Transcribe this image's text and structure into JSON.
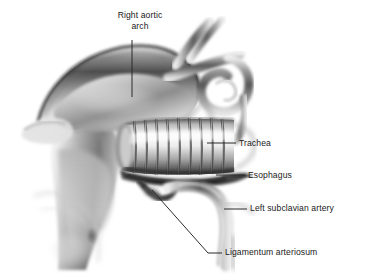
{
  "figure": {
    "style": "grayscale airbrush medical illustration",
    "background_color": "#ffffff",
    "label_color": "#1a1a1a",
    "leader_line_color": "#2b2b2b"
  },
  "labels": {
    "right_aortic_arch": "Right aortic\narch",
    "right_aortic_arch_line1": "Right aortic",
    "right_aortic_arch_line2": "arch",
    "trachea": "Trachea",
    "esophagus": "Esophagus",
    "left_subclavian_artery": "Left subclavian artery",
    "ligamentum_arteriosum": "Ligamentum arteriosum"
  },
  "leader_lines": [
    {
      "name": "right-aortic-arch-leader",
      "type": "vertical",
      "x1": 132,
      "y1": 40,
      "x2": 132,
      "y2": 97
    },
    {
      "name": "trachea-leader",
      "type": "horizontal",
      "x1": 207,
      "y1": 143,
      "x2": 236,
      "y2": 143
    },
    {
      "name": "esophagus-leader",
      "type": "horizontal",
      "x1": 216,
      "y1": 175,
      "x2": 245,
      "y2": 175
    },
    {
      "name": "left-subclavian-leader",
      "type": "horizontal",
      "x1": 224,
      "y1": 209,
      "x2": 247,
      "y2": 209
    },
    {
      "name": "ligamentum-leader",
      "type": "elbow",
      "x1": 152,
      "y1": 190,
      "x2": 208,
      "y2": 253,
      "x3": 222,
      "y3": 253
    }
  ],
  "structures": [
    {
      "name": "right-aortic-arch",
      "description": "large shaded dome arching across upper-left to center"
    },
    {
      "name": "brachiocephalic-branch-vessels",
      "description": "crossing vessels forming a loop at upper right"
    },
    {
      "name": "trachea",
      "description": "horizontal tube with cartilage rings, center of image",
      "cartilage_ring_count": 9
    },
    {
      "name": "esophagus",
      "description": "dark horizontal band immediately below trachea"
    },
    {
      "name": "left-subclavian-artery",
      "description": "vessel arching downward to the right below esophagus"
    },
    {
      "name": "ligamentum-arteriosum",
      "description": "short dark fibrous band at center-bottom junction"
    },
    {
      "name": "descending-aorta",
      "description": "broad shaded column on left fading toward bottom"
    }
  ]
}
